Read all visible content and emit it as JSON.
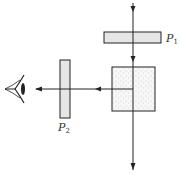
{
  "diagram": {
    "labels": {
      "p1_main": "P",
      "p1_sub": "1",
      "p2_main": "P",
      "p2_sub": "2"
    },
    "colors": {
      "stroke": "#222222",
      "polarizer_fill": "#e6e6e6",
      "crystal_fill": "#f7f7f7",
      "dots": "#9a9a9a"
    },
    "elements": [
      {
        "id": "polarizer-p1",
        "type": "rect",
        "x": 104,
        "y": 32,
        "w": 57,
        "h": 11
      },
      {
        "id": "polarizer-p2",
        "type": "rect",
        "x": 60,
        "y": 60,
        "w": 10,
        "h": 58
      },
      {
        "id": "scattering-medium",
        "type": "rect",
        "x": 112,
        "y": 67,
        "w": 43,
        "h": 44
      },
      {
        "id": "vertical-beam",
        "type": "arrow",
        "x": 133,
        "y1": 4,
        "y2": 170
      },
      {
        "id": "horizontal-beam",
        "type": "arrow",
        "x1": 133,
        "x2": 36,
        "y": 89
      },
      {
        "id": "observer-eye",
        "type": "icon",
        "x": 5,
        "y": 89
      }
    ]
  }
}
